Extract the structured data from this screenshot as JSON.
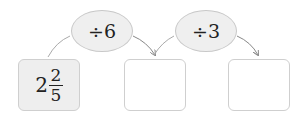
{
  "operations": [
    {
      "symbol": "÷",
      "operand": "6",
      "label": "÷6"
    },
    {
      "symbol": "÷",
      "operand": "3",
      "label": "÷3"
    }
  ],
  "boxes": [
    {
      "whole": "2",
      "numerator": "2",
      "denominator": "5"
    },
    {
      "value": ""
    },
    {
      "value": ""
    }
  ]
}
